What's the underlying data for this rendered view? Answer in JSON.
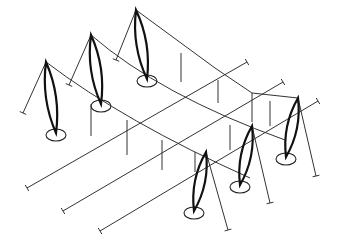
{
  "diagram": {
    "style": {
      "line_color": "#333333",
      "mast_color": "#111111",
      "background": "#ffffff"
    },
    "masts": [
      {
        "id": "back-1",
        "top": [
          46,
          62
        ],
        "base": [
          56,
          133
        ],
        "stay_end": [
          23,
          113
        ]
      },
      {
        "id": "back-2",
        "top": [
          91,
          35
        ],
        "base": [
          101,
          104
        ],
        "stay_end": [
          69,
          85
        ]
      },
      {
        "id": "back-3",
        "top": [
          136,
          10
        ],
        "base": [
          147,
          79
        ],
        "stay_end": [
          116,
          60
        ]
      },
      {
        "id": "front-1",
        "top": [
          298,
          98
        ],
        "base": [
          286,
          157
        ],
        "stay_end": [
          316,
          176
        ]
      },
      {
        "id": "front-2",
        "top": [
          252,
          126
        ],
        "base": [
          240,
          185
        ],
        "stay_end": [
          270,
          203
        ]
      },
      {
        "id": "front-3",
        "top": [
          206,
          152
        ],
        "base": [
          194,
          211
        ],
        "stay_end": [
          228,
          230
        ]
      }
    ],
    "edge_cables": [
      {
        "id": "back-ridge",
        "points": [
          [
            46,
            62
          ],
          [
            125,
            122
          ],
          [
            250,
            178
          ]
        ]
      },
      {
        "id": "back-ridge-2",
        "points": [
          [
            91,
            35
          ],
          [
            160,
            95
          ],
          [
            285,
            140
          ]
        ]
      },
      {
        "id": "back-ridge-3",
        "points": [
          [
            136,
            10
          ],
          [
            215,
            68
          ],
          [
            252,
            93
          ],
          [
            298,
            98
          ]
        ]
      }
    ],
    "tie_cables": [
      {
        "id": "tie-1",
        "from": [
          27,
          188
        ],
        "to": [
          247,
          62
        ]
      },
      {
        "id": "tie-2",
        "from": [
          63,
          211
        ],
        "to": [
          283,
          82
        ]
      },
      {
        "id": "tie-3",
        "from": [
          100,
          231
        ],
        "to": [
          318,
          101
        ]
      }
    ],
    "hangers": [
      [
        [
          181,
          53
        ],
        [
          181,
          82
        ]
      ],
      [
        [
          218,
          80
        ],
        [
          218,
          103
        ]
      ],
      [
        [
          252,
          93
        ],
        [
          252,
          122
        ]
      ],
      [
        [
          91,
          104
        ],
        [
          91,
          136
        ]
      ],
      [
        [
          127,
          120
        ],
        [
          127,
          155
        ]
      ],
      [
        [
          162,
          140
        ],
        [
          162,
          170
        ]
      ],
      [
        [
          195,
          152
        ],
        [
          195,
          172
        ]
      ],
      [
        [
          230,
          125
        ],
        [
          230,
          150
        ]
      ],
      [
        [
          270,
          101
        ],
        [
          270,
          126
        ]
      ]
    ]
  }
}
